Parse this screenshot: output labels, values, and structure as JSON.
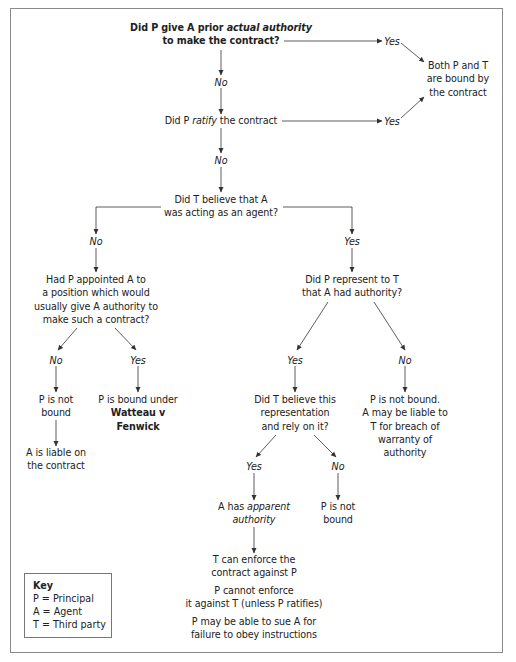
{
  "diagram": {
    "type": "flowchart",
    "nodes": {
      "q_actual_authority": {
        "line1_pre": "Did P give A prior ",
        "line1_em": "actual authority",
        "line2": "to make the contract?"
      },
      "both_bound": [
        "Both P and T",
        "are bound by",
        "the contract"
      ],
      "q_ratify": {
        "pre": "Did P ",
        "em": "ratify",
        "post": " the contract"
      },
      "q_believe_agent": [
        "Did T believe that A",
        "was acting as an agent?"
      ],
      "q_appointed_position": [
        "Had P appointed A to",
        "a position which would",
        "usually give A authority to",
        "make such a contract?"
      ],
      "q_represent": [
        "Did P represent to T",
        "that A had authority?"
      ],
      "p_not_bound_left": [
        "P is not",
        "bound"
      ],
      "a_liable": [
        "A is liable on",
        "the contract"
      ],
      "watteau": {
        "line1": "P is bound under",
        "case_line1": "Watteau v",
        "case_line2": "Fenwick"
      },
      "q_believe_rely": [
        "Did T believe this",
        "representation",
        "and rely on it?"
      ],
      "p_not_bound_warranty": [
        "P is not bound.",
        "A may be liable to",
        "T for breach of",
        "warranty of",
        "authority"
      ],
      "apparent_authority": {
        "pre": "A has ",
        "em1": "apparent",
        "em2": "authority"
      },
      "p_not_bound_right": [
        "P is not",
        "bound"
      ],
      "outcome_enforce": [
        "T can enforce the",
        "contract against P"
      ],
      "outcome_cannot_enforce": [
        "P cannot enforce",
        "it against T (unless P ratifies)"
      ],
      "outcome_sue": [
        "P may be able to sue A for",
        "failure to obey instructions"
      ]
    },
    "edge_labels": {
      "yes": "Yes",
      "no": "No"
    },
    "edges": [
      {
        "from": "q_actual_authority",
        "label": "Yes",
        "to": "both_bound"
      },
      {
        "from": "q_actual_authority",
        "label": "No",
        "to": "q_ratify"
      },
      {
        "from": "q_ratify",
        "label": "Yes",
        "to": "both_bound"
      },
      {
        "from": "q_ratify",
        "label": "No",
        "to": "q_believe_agent"
      },
      {
        "from": "q_believe_agent",
        "label": "No",
        "to": "q_appointed_position"
      },
      {
        "from": "q_believe_agent",
        "label": "Yes",
        "to": "q_represent"
      },
      {
        "from": "q_appointed_position",
        "label": "No",
        "to": "p_not_bound_left"
      },
      {
        "from": "p_not_bound_left",
        "label": "",
        "to": "a_liable"
      },
      {
        "from": "q_appointed_position",
        "label": "Yes",
        "to": "watteau"
      },
      {
        "from": "q_represent",
        "label": "Yes",
        "to": "q_believe_rely"
      },
      {
        "from": "q_represent",
        "label": "No",
        "to": "p_not_bound_warranty"
      },
      {
        "from": "q_believe_rely",
        "label": "Yes",
        "to": "apparent_authority"
      },
      {
        "from": "q_believe_rely",
        "label": "No",
        "to": "p_not_bound_right"
      },
      {
        "from": "apparent_authority",
        "label": "",
        "to": "outcome_enforce"
      }
    ],
    "key": {
      "title": "Key",
      "entries": [
        "P = Principal",
        "A = Agent",
        "T = Third party"
      ]
    },
    "colors": {
      "line": "#333333",
      "frame": "#8a8a8a",
      "text": "#222222"
    }
  }
}
